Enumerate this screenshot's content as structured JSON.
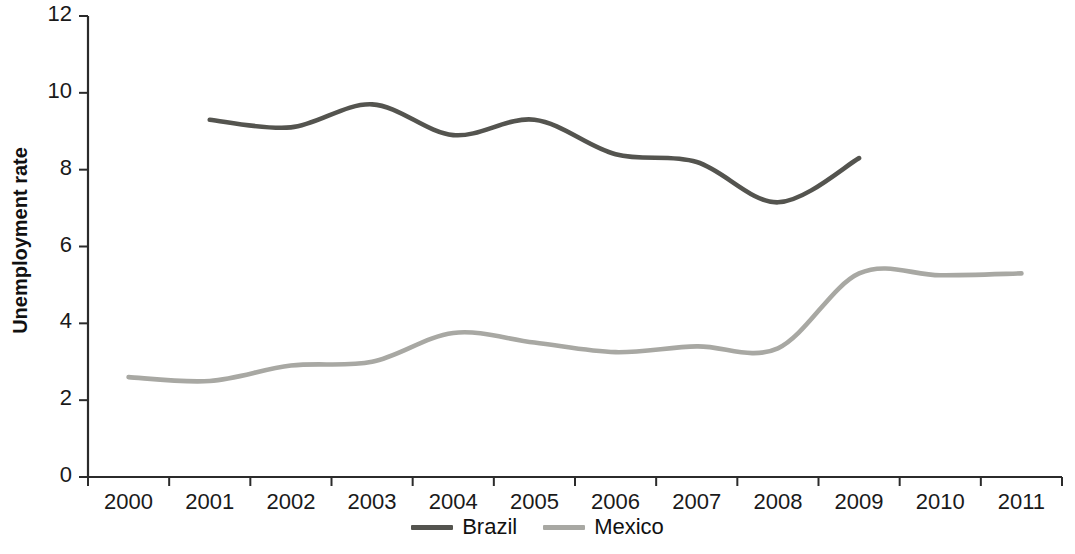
{
  "chart_data": {
    "type": "line",
    "title": "",
    "subtitle": "",
    "xlabel": "",
    "ylabel": "Unemployment rate",
    "categories": [
      "2000",
      "2001",
      "2002",
      "2003",
      "2004",
      "2005",
      "2006",
      "2007",
      "2008",
      "2009",
      "2010",
      "2011"
    ],
    "x_tick_labels": [
      "2000",
      "2001",
      "2002",
      "2003",
      "2004",
      "2005",
      "2006",
      "2007",
      "2008",
      "2009",
      "2010",
      "2011"
    ],
    "y_tick_labels": [
      "0",
      "2",
      "4",
      "6",
      "8",
      "10",
      "12"
    ],
    "y_ticks": [
      0,
      2,
      4,
      6,
      8,
      10,
      12
    ],
    "ylim": [
      0,
      12
    ],
    "grid": false,
    "legend_position": "bottom-center",
    "smoothed": true,
    "series": [
      {
        "name": "Brazil",
        "color": "#54544f",
        "values": [
          null,
          9.3,
          9.1,
          9.7,
          8.9,
          9.3,
          8.4,
          8.2,
          7.15,
          8.3,
          null,
          null
        ]
      },
      {
        "name": "Mexico",
        "color": "#a8a8a3",
        "values": [
          2.6,
          2.5,
          2.9,
          3.0,
          3.75,
          3.5,
          3.25,
          3.4,
          3.35,
          5.3,
          5.25,
          5.3
        ]
      }
    ]
  },
  "legend": {
    "items": [
      {
        "label": "Brazil",
        "color": "#54544f"
      },
      {
        "label": "Mexico",
        "color": "#a8a8a3"
      }
    ]
  },
  "axis": {
    "y_title": "Unemployment rate",
    "axis_color": "#2b2b2b"
  }
}
